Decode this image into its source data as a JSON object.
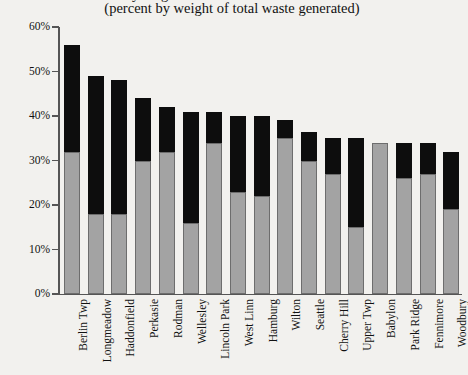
{
  "chart_data": {
    "type": "bar",
    "subtype": "stacked-bar",
    "title": "Recycling Rates of Selected Communities",
    "subtitle": "(percent by weight of total waste generated)",
    "xlabel": "",
    "ylabel": "",
    "ylim": [
      0,
      60
    ],
    "ytick_values": [
      0,
      10,
      20,
      30,
      40,
      50,
      60
    ],
    "ytick_labels": [
      "0%",
      "10%",
      "20%",
      "30%",
      "40%",
      "50%",
      "60%"
    ],
    "grid": false,
    "legend": null,
    "categories": [
      "Berlin Twp",
      "Longmeadow",
      "Haddonfield",
      "Perkasie",
      "Rodman",
      "Wellesley",
      "Lincoln Park",
      "West Linn",
      "Hamburg",
      "Wilton",
      "Seattle",
      "Cherry Hill",
      "Upper Twp",
      "Babylon",
      "Park Ridge",
      "Fennimore",
      "Woodbury"
    ],
    "series": [
      {
        "name": "lower-segment",
        "color": "#a3a3a3",
        "values": [
          32,
          18,
          18,
          30,
          32,
          16,
          34,
          23,
          22,
          35,
          30,
          27,
          15,
          34,
          26,
          27,
          19
        ]
      },
      {
        "name": "upper-segment",
        "color": "#0d0d0d",
        "values": [
          24,
          31,
          30,
          14,
          10,
          25,
          7,
          17,
          18,
          4,
          6.5,
          8,
          20,
          0,
          8,
          7,
          13
        ]
      }
    ],
    "totals": [
      56,
      49,
      48,
      44,
      42,
      41,
      41,
      40,
      40,
      39,
      36.5,
      35,
      35,
      34,
      34,
      34,
      32
    ]
  }
}
